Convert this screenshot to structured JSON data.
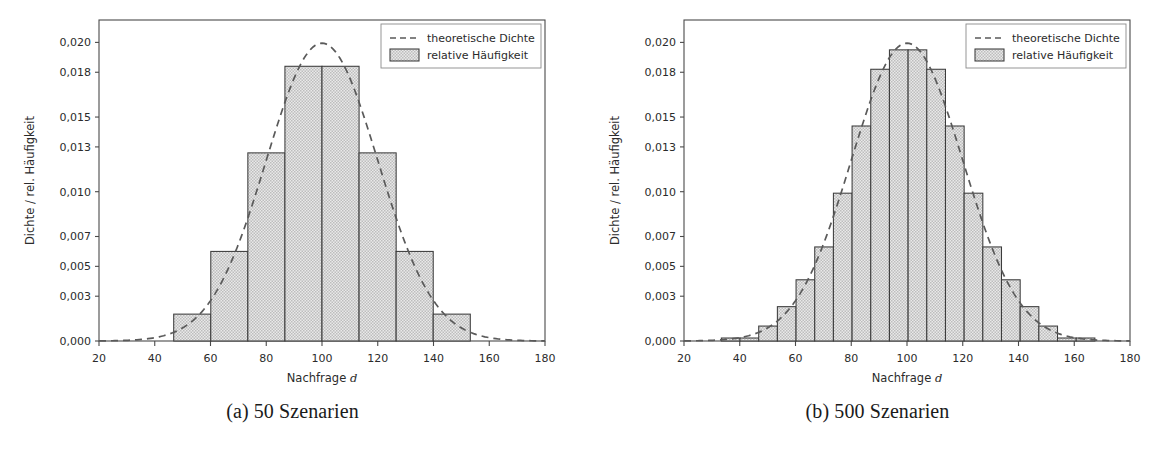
{
  "figure": {
    "background": "#ffffff",
    "bar_fill_color": "#d3d3d3",
    "bar_edge_color": "#3c3c3c",
    "density_color": "#5a5a5a",
    "axis_color": "#4a4a4a"
  },
  "panels": [
    {
      "id": "panel-a",
      "caption": "(a) 50 Szenarien",
      "chart_data": {
        "type": "bar",
        "title": "",
        "xlabel": "Nachfrage",
        "xlabel_italic": "d",
        "ylabel": "Dichte / rel. Häufigkeit",
        "xlim": [
          20,
          180
        ],
        "ylim": [
          0.0,
          0.0215
        ],
        "grid": false,
        "legend_position": "upper right",
        "xticks": [
          20,
          40,
          60,
          80,
          100,
          120,
          140,
          160,
          180
        ],
        "xticklabels": [
          "20",
          "40",
          "60",
          "80",
          "100",
          "120",
          "140",
          "160",
          "180"
        ],
        "yticks": [
          0.0,
          0.003,
          0.005,
          0.007,
          0.01,
          0.013,
          0.015,
          0.018,
          0.02
        ],
        "yticklabels": [
          "0,000",
          "0,003",
          "0,005",
          "0,007",
          "0,010",
          "0,013",
          "0,015",
          "0,018",
          "0,020"
        ],
        "legend": [
          {
            "label": "theoretische Dichte",
            "marker": "dashed-line"
          },
          {
            "label": "relative Häufigkeit",
            "marker": "filled-box"
          }
        ],
        "bin_edges": [
          46.8,
          60.1,
          73.4,
          86.7,
          100.0,
          113.3,
          126.6,
          139.9,
          153.2
        ],
        "values": [
          0.0018,
          0.006,
          0.0126,
          0.0184,
          0.0184,
          0.0126,
          0.006,
          0.0018
        ],
        "series": [
          {
            "name": "theoretische Dichte",
            "type": "line",
            "style": "dashed",
            "mu": 100,
            "sigma": 20,
            "peak": 0.01995
          }
        ]
      }
    },
    {
      "id": "panel-b",
      "caption": "(b) 500 Szenarien",
      "chart_data": {
        "type": "bar",
        "title": "",
        "xlabel": "Nachfrage",
        "xlabel_italic": "d",
        "ylabel": "Dichte / rel. Häufigkeit",
        "xlim": [
          20,
          180
        ],
        "ylim": [
          0.0,
          0.0215
        ],
        "grid": false,
        "legend_position": "upper right",
        "xticks": [
          20,
          40,
          60,
          80,
          100,
          120,
          140,
          160,
          180
        ],
        "xticklabels": [
          "20",
          "40",
          "60",
          "80",
          "100",
          "120",
          "140",
          "160",
          "180"
        ],
        "yticks": [
          0.0,
          0.003,
          0.005,
          0.007,
          0.01,
          0.013,
          0.015,
          0.018,
          0.02
        ],
        "yticklabels": [
          "0,000",
          "0,003",
          "0,005",
          "0,007",
          "0,010",
          "0,013",
          "0,015",
          "0,018",
          "0,020"
        ],
        "legend": [
          {
            "label": "theoretische Dichte",
            "marker": "dashed-line"
          },
          {
            "label": "relative Häufigkeit",
            "marker": "filled-box"
          }
        ],
        "bin_edges": [
          33.4,
          40.1,
          46.8,
          53.5,
          60.2,
          66.9,
          73.6,
          80.3,
          87.0,
          93.7,
          100.4,
          107.1,
          113.8,
          120.5,
          127.2,
          133.9,
          140.6,
          147.3,
          154.0,
          160.7,
          167.4
        ],
        "values": [
          0.0002,
          0.0002,
          0.001,
          0.0023,
          0.0041,
          0.0063,
          0.0099,
          0.0144,
          0.0182,
          0.0195,
          0.0195,
          0.0182,
          0.0144,
          0.0099,
          0.0063,
          0.0041,
          0.0023,
          0.001,
          0.0002,
          0.0002
        ],
        "series": [
          {
            "name": "theoretische Dichte",
            "type": "line",
            "style": "dashed",
            "mu": 100,
            "sigma": 20,
            "peak": 0.01995
          }
        ]
      }
    }
  ]
}
